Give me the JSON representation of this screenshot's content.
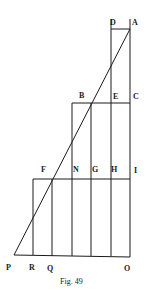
{
  "figure": {
    "caption": "Fig. 49",
    "colors": {
      "ink": "#1a1a1a",
      "paper": "#ffffff"
    },
    "labels": {
      "A": "A",
      "B": "B",
      "C": "C",
      "D": "D",
      "E": "E",
      "F": "F",
      "G": "G",
      "H": "H",
      "I": "I",
      "N": "N",
      "O": "O",
      "P": "P",
      "Q": "Q",
      "R": "R"
    },
    "points": {
      "A": [
        130,
        29
      ],
      "D": [
        111,
        29
      ],
      "B": [
        91,
        103
      ],
      "E": [
        111,
        103
      ],
      "C": [
        130,
        103
      ],
      "F": [
        52,
        179
      ],
      "N": [
        72,
        179
      ],
      "G": [
        91,
        179
      ],
      "H": [
        111,
        179
      ],
      "I": [
        130,
        179
      ],
      "P": [
        14,
        255
      ],
      "R": [
        33,
        255
      ],
      "Q": [
        52,
        256
      ],
      "O": [
        130,
        257
      ]
    }
  }
}
